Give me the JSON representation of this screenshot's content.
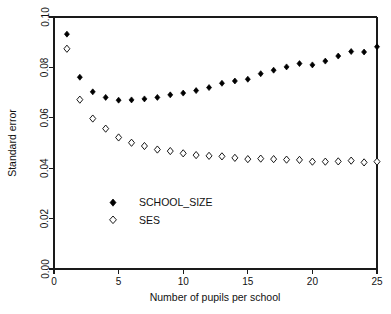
{
  "chart_data": {
    "type": "scatter",
    "title": "",
    "xlabel": "Number of pupils per school",
    "ylabel": "Standard error",
    "xlim": [
      0,
      25
    ],
    "ylim": [
      0.0,
      0.1
    ],
    "xticks": [
      "0",
      "5",
      "10",
      "15",
      "20",
      "25"
    ],
    "xtick_values": [
      0,
      5,
      10,
      15,
      20,
      25
    ],
    "yticks": [
      "0.00",
      "0.02",
      "0.04",
      "0.06",
      "0.08",
      "0.10"
    ],
    "ytick_values": [
      0.0,
      0.02,
      0.04,
      0.06,
      0.08,
      0.1
    ],
    "grid": false,
    "legend_position": "center-left-inside",
    "x": [
      1,
      2,
      3,
      4,
      5,
      6,
      7,
      8,
      9,
      10,
      11,
      12,
      13,
      14,
      15,
      16,
      17,
      18,
      19,
      20,
      21,
      22,
      23,
      24,
      25
    ],
    "series": [
      {
        "name": "SCHOOL_SIZE",
        "marker": "filled-diamond",
        "color": "#000000",
        "values": [
          0.0932,
          0.0761,
          0.0703,
          0.0681,
          0.067,
          0.0671,
          0.0675,
          0.0681,
          0.0691,
          0.0698,
          0.0708,
          0.072,
          0.0737,
          0.0746,
          0.0753,
          0.0775,
          0.0789,
          0.0802,
          0.0815,
          0.081,
          0.0825,
          0.0845,
          0.0863,
          0.0861,
          0.0882
        ]
      },
      {
        "name": "SES",
        "marker": "open-diamond",
        "color": "#000000",
        "values": [
          0.0874,
          0.0672,
          0.0597,
          0.0557,
          0.0522,
          0.0501,
          0.0488,
          0.0474,
          0.0468,
          0.0459,
          0.0452,
          0.0449,
          0.0447,
          0.0441,
          0.0436,
          0.0438,
          0.0436,
          0.0434,
          0.0433,
          0.0426,
          0.0426,
          0.0427,
          0.043,
          0.0423,
          0.0426
        ]
      }
    ]
  },
  "legend": {
    "entries": [
      {
        "label": "SCHOOL_SIZE",
        "marker": "filled-diamond"
      },
      {
        "label": "SES",
        "marker": "open-diamond"
      }
    ]
  }
}
